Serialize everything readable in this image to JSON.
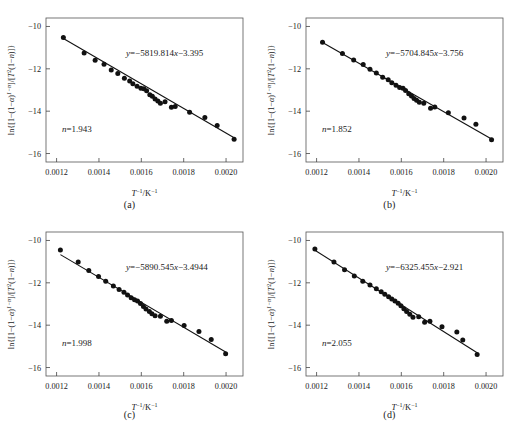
{
  "figure": {
    "type": "multi-panel-scatter-with-fit",
    "panel_count": 4,
    "shared": {
      "xlabel": "T⁻¹/K⁻¹",
      "ylabel": "ln{[1−(1−α)¹⁻ⁿ]/[T²(1−n)]}",
      "xticks": [
        "0.0012",
        "0.0014",
        "0.0016",
        "0.0018",
        "0.0020"
      ],
      "xtick_values": [
        0.0012,
        0.0014,
        0.0016,
        0.0018,
        0.002
      ],
      "yticks": [
        "−10",
        "−12",
        "−14",
        "−16"
      ],
      "ytick_values": [
        -10,
        -12,
        -14,
        -16
      ],
      "xlim": [
        0.00115,
        0.00208
      ],
      "ylim": [
        -16.4,
        -9.6
      ],
      "grid": false,
      "legend": "none",
      "marker": "filled-circle",
      "marker_color": "#111111",
      "line_color": "#111111"
    },
    "panels": [
      {
        "id": "a",
        "caption": "(a)",
        "equation": "y=−5819.814x−3.395",
        "slope": -5819.814,
        "intercept": -3.395,
        "n_label": "n=1.943",
        "n_value": 1.943,
        "chart_data": {
          "type": "scatter",
          "title": "",
          "xlabel": "T⁻¹/K⁻¹",
          "ylabel": "ln{[1−(1−α)¹⁻ⁿ]/[T²(1−n)]}",
          "xlim": [
            0.00115,
            0.00208
          ],
          "ylim": [
            -16.4,
            -9.6
          ],
          "x": [
            0.001232,
            0.00133,
            0.001382,
            0.001424,
            0.001458,
            0.001489,
            0.00152,
            0.001545,
            0.00156,
            0.00158,
            0.001598,
            0.001612,
            0.001625,
            0.00164,
            0.001652,
            0.001665,
            0.001678,
            0.00169,
            0.001712,
            0.001742,
            0.00176,
            0.001828,
            0.0019,
            0.001958,
            0.002038
          ],
          "y": [
            -10.52,
            -11.25,
            -11.6,
            -11.78,
            -12.05,
            -12.22,
            -12.45,
            -12.58,
            -12.7,
            -12.82,
            -12.92,
            -12.94,
            -13.04,
            -13.22,
            -13.3,
            -13.42,
            -13.52,
            -13.62,
            -13.56,
            -13.82,
            -13.78,
            -14.05,
            -14.3,
            -14.68,
            -15.33
          ],
          "fit_line": {
            "slope": -5819.814,
            "intercept": -3.395
          }
        }
      },
      {
        "id": "b",
        "caption": "(b)",
        "equation": "y=−5704.845x−3.756",
        "slope": -5704.845,
        "intercept": -3.756,
        "n_label": "n=1.852",
        "n_value": 1.852,
        "chart_data": {
          "type": "scatter",
          "title": "",
          "xlabel": "T⁻¹/K⁻¹",
          "ylabel": "ln{[1−(1−α)¹⁻ⁿ]/[T²(1−n)]}",
          "xlim": [
            0.00115,
            0.00208
          ],
          "ylim": [
            -16.4,
            -9.6
          ],
          "x": [
            0.001228,
            0.001322,
            0.001375,
            0.00142,
            0.001452,
            0.001482,
            0.001512,
            0.001538,
            0.001555,
            0.001575,
            0.001592,
            0.001608,
            0.00162,
            0.001635,
            0.001648,
            0.00166,
            0.001672,
            0.001685,
            0.001706,
            0.001738,
            0.001758,
            0.001822,
            0.001896,
            0.001952,
            0.002026
          ],
          "y": [
            -10.75,
            -11.28,
            -11.58,
            -11.8,
            -12.02,
            -12.2,
            -12.4,
            -12.52,
            -12.66,
            -12.78,
            -12.88,
            -12.92,
            -13.02,
            -13.18,
            -13.28,
            -13.4,
            -13.48,
            -13.58,
            -13.62,
            -13.86,
            -13.8,
            -14.08,
            -14.32,
            -14.62,
            -15.35
          ],
          "fit_line": {
            "slope": -5704.845,
            "intercept": -3.756
          }
        }
      },
      {
        "id": "c",
        "caption": "(c)",
        "equation": "y=−5890.545x−3.4944",
        "slope": -5890.545,
        "intercept": -3.4944,
        "n_label": "n=1.998",
        "n_value": 1.998,
        "chart_data": {
          "type": "scatter",
          "title": "",
          "xlabel": "T⁻¹/K⁻¹",
          "ylabel": "ln{[1−(1−α)¹⁻ⁿ]/[T²(1−n)]}",
          "xlim": [
            0.00115,
            0.00208
          ],
          "ylim": [
            -16.4,
            -9.6
          ],
          "x": [
            0.001218,
            0.001302,
            0.001352,
            0.001398,
            0.001432,
            0.001468,
            0.001495,
            0.001518,
            0.001535,
            0.001552,
            0.001568,
            0.001582,
            0.001596,
            0.00161,
            0.001622,
            0.001638,
            0.00165,
            0.001665,
            0.00169,
            0.00172,
            0.001742,
            0.001802,
            0.001872,
            0.00193,
            0.001998
          ],
          "y": [
            -10.45,
            -11.02,
            -11.42,
            -11.7,
            -11.92,
            -12.15,
            -12.32,
            -12.45,
            -12.58,
            -12.7,
            -12.8,
            -12.86,
            -12.98,
            -13.12,
            -13.24,
            -13.36,
            -13.46,
            -13.56,
            -13.58,
            -13.82,
            -13.78,
            -14.02,
            -14.3,
            -14.68,
            -15.35
          ],
          "fit_line": {
            "slope": -5890.545,
            "intercept": -3.4944
          }
        }
      },
      {
        "id": "d",
        "caption": "(d)",
        "equation": "y=−6325.455x−2.921",
        "slope": -6325.455,
        "intercept": -2.921,
        "n_label": "n=2.055",
        "n_value": 2.055,
        "chart_data": {
          "type": "scatter",
          "title": "",
          "xlabel": "T⁻¹/K⁻¹",
          "ylabel": "ln{[1−(1−α)¹⁻ⁿ]/[T²(1−n)]}",
          "xlim": [
            0.00115,
            0.00208
          ],
          "ylim": [
            -16.4,
            -9.6
          ],
          "x": [
            0.001192,
            0.001282,
            0.001332,
            0.001378,
            0.001418,
            0.001452,
            0.001482,
            0.001505,
            0.001522,
            0.00154,
            0.001555,
            0.00157,
            0.001585,
            0.001598,
            0.001612,
            0.001625,
            0.00164,
            0.001655,
            0.001682,
            0.00171,
            0.001735,
            0.001792,
            0.001862,
            0.00189,
            0.001958
          ],
          "y": [
            -10.4,
            -11.02,
            -11.38,
            -11.68,
            -11.92,
            -12.1,
            -12.28,
            -12.42,
            -12.54,
            -12.66,
            -12.76,
            -12.86,
            -12.96,
            -13.08,
            -13.22,
            -13.36,
            -13.48,
            -13.62,
            -13.6,
            -13.86,
            -13.82,
            -14.08,
            -14.32,
            -14.7,
            -15.38
          ],
          "fit_line": {
            "slope": -6325.455,
            "intercept": -2.921
          }
        }
      }
    ]
  }
}
